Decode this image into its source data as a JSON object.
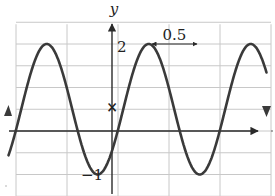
{
  "chart_data": {
    "type": "line",
    "title": "",
    "xlabel": "x",
    "ylabel": "y",
    "function_description": "Sinusoid oscillating between minimum -1 and maximum 2 (midline 0.5, amplitude 1.5), period 0.5; y-intercept marked at 0.5 with curve decreasing through the y-axis",
    "series": [
      {
        "name": "y = 0.5 + 1.5·cos(4π(x − 0.18))",
        "max": 2,
        "min": -1,
        "midline": 0.5,
        "amplitude": 1.5,
        "period": 0.5,
        "y_intercept": 0.5,
        "peaks_x": [
          -0.32,
          -0.07,
          0.18,
          0.43,
          0.68
        ],
        "troughs_x": [
          -0.45,
          -0.2,
          0.05,
          0.3,
          0.55
        ]
      }
    ],
    "annotations": [
      {
        "text": "2",
        "type": "y-tick-label",
        "value": 2
      },
      {
        "text": "−1",
        "type": "y-tick-label",
        "value": -1
      },
      {
        "text": "0.5",
        "type": "period-marker",
        "description": "double-headed arrow between two consecutive peaks"
      },
      {
        "text": "×",
        "type": "point-marker",
        "description": "y-intercept at (0, 0.5)"
      }
    ],
    "xlim": [
      -0.5,
      0.75
    ],
    "ylim": [
      -1.5,
      2.5
    ],
    "grid": true,
    "grid_spacing": {
      "x": 0.25,
      "y": 0.5
    },
    "legend": "none"
  },
  "labels": {
    "y_axis": "y",
    "x_axis": "x",
    "y_tick_max": "2",
    "y_tick_min": "−1",
    "period_label": "0.5",
    "intercept_marker": "×"
  },
  "colors": {
    "curve": "#3a3a3a",
    "axis": "#2a2a2a",
    "grid": "#c8c8c8",
    "background": "#ffffff"
  }
}
